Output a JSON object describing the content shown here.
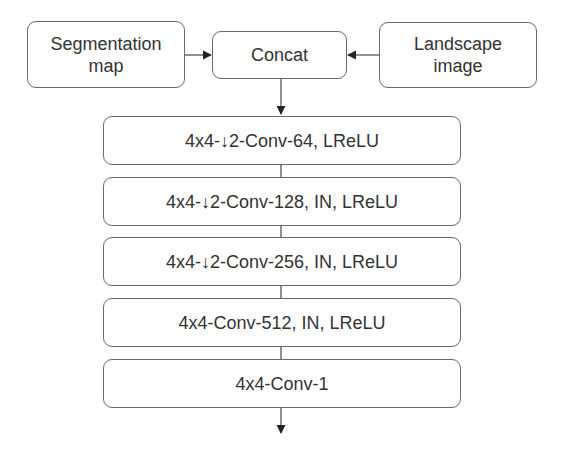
{
  "diagram": {
    "inputs": {
      "left": {
        "line1": "Segmentation",
        "line2": "map"
      },
      "center": "Concat",
      "right": {
        "line1": "Landscape",
        "line2": "image"
      }
    },
    "layers": [
      {
        "label": "4x4-↓2-Conv-64, LReLU"
      },
      {
        "label": "4x4-↓2-Conv-128, IN, LReLU"
      },
      {
        "label": "4x4-↓2-Conv-256, IN, LReLU"
      },
      {
        "label": "4x4-Conv-512, IN, LReLU"
      },
      {
        "label": "4x4-Conv-1"
      }
    ],
    "colors": {
      "border": "#6a6a6a",
      "text": "#333333",
      "arrow": "#222222"
    }
  }
}
